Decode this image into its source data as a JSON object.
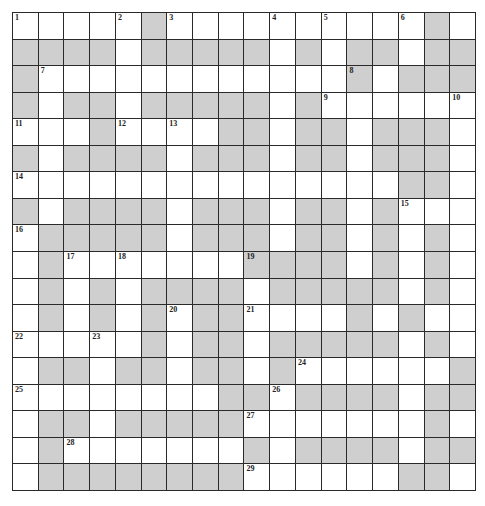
{
  "puzzle": {
    "rows": 18,
    "cols": 18,
    "colors": {
      "open": "#ffffff",
      "block": "#cfcfcf",
      "line": "#2a2a2a",
      "number": "#222222"
    },
    "grid": [
      ".....#..........#",
      "####.#####.#.##.##",
      "#............#.###",
      "#.##.#####.#......",
      "...#....##.##.###.",
      "#.####.###.##.###.",
      "...............##.",
      "#.####.###.##.#...",
      ".#####.###.##.#.#.",
      ".#.......####.#.#.",
      ".#.#.####.#####.#.",
      ".#.#.#.##....#.#.",
      ".....#.##.#####.#.",
      ".##.##.##.#......#",
      "........##.####.##",
      ".##.#####.......#",
      ".#.......#.####.##",
      ".########......##"
    ],
    "numbers": [
      {
        "n": "1",
        "r": 0,
        "c": 0
      },
      {
        "n": "2",
        "r": 0,
        "c": 4
      },
      {
        "n": "3",
        "r": 0,
        "c": 6
      },
      {
        "n": "4",
        "r": 0,
        "c": 10
      },
      {
        "n": "5",
        "r": 0,
        "c": 12
      },
      {
        "n": "6",
        "r": 0,
        "c": 15
      },
      {
        "n": "7",
        "r": 2,
        "c": 1
      },
      {
        "n": "8",
        "r": 2,
        "c": 13
      },
      {
        "n": "9",
        "r": 3,
        "c": 12
      },
      {
        "n": "10",
        "r": 3,
        "c": 17
      },
      {
        "n": "11",
        "r": 4,
        "c": 0
      },
      {
        "n": "12",
        "r": 4,
        "c": 4
      },
      {
        "n": "13",
        "r": 4,
        "c": 6
      },
      {
        "n": "14",
        "r": 6,
        "c": 0
      },
      {
        "n": "15",
        "r": 7,
        "c": 15
      },
      {
        "n": "16",
        "r": 8,
        "c": 0
      },
      {
        "n": "17",
        "r": 9,
        "c": 2
      },
      {
        "n": "18",
        "r": 9,
        "c": 4
      },
      {
        "n": "19",
        "r": 9,
        "c": 9
      },
      {
        "n": "20",
        "r": 11,
        "c": 6
      },
      {
        "n": "21",
        "r": 11,
        "c": 9
      },
      {
        "n": "22",
        "r": 12,
        "c": 0
      },
      {
        "n": "23",
        "r": 12,
        "c": 3
      },
      {
        "n": "24",
        "r": 13,
        "c": 11
      },
      {
        "n": "25",
        "r": 14,
        "c": 0
      },
      {
        "n": "26",
        "r": 14,
        "c": 10
      },
      {
        "n": "27",
        "r": 15,
        "c": 9
      },
      {
        "n": "28",
        "r": 16,
        "c": 2
      },
      {
        "n": "29",
        "r": 17,
        "c": 9
      }
    ]
  }
}
